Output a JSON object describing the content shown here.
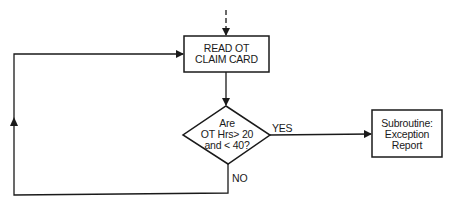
{
  "diagram": {
    "type": "flowchart",
    "colors": {
      "line": "#1a1a1a",
      "background": "#ffffff"
    },
    "nodes": [
      {
        "id": "read",
        "shape": "rectangle",
        "label_lines": [
          "READ OT",
          "CLAIM CARD"
        ]
      },
      {
        "id": "decision",
        "shape": "diamond",
        "label_lines": [
          "Are",
          "OT Hrs> 20",
          "and < 40?"
        ]
      },
      {
        "id": "subroutine",
        "shape": "rectangle",
        "label_lines": [
          "Subroutine:",
          "Exception",
          "Report"
        ]
      }
    ],
    "edges": [
      {
        "from": "entry",
        "to": "read",
        "style": "dashed",
        "label": ""
      },
      {
        "from": "read",
        "to": "decision",
        "label": ""
      },
      {
        "from": "decision",
        "to": "subroutine",
        "label": "YES"
      },
      {
        "from": "decision",
        "to": "read",
        "label": "NO"
      }
    ]
  }
}
